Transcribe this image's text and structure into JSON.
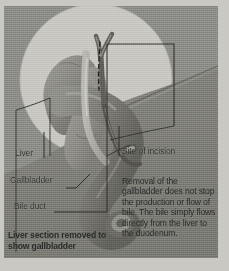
{
  "figure": {
    "type": "medical-illustration",
    "style": "grayscale halftone print scan"
  },
  "labels": {
    "liver": "Liver",
    "gallbladder": "Gallbladder",
    "bile_duct": "Bile duct",
    "site_of_incision": "Site of incision"
  },
  "body_text": {
    "removal_note": "Removal of the gallbladder does not stop the production or flow of bile. The bile simply flows directly from the liver to the duodenum."
  },
  "captions": {
    "liver_section": "Liver section removed to show gallbladder"
  },
  "colors": {
    "page_background": "#c9c8c3",
    "panel_background": "#8d8d88",
    "inset_circle": "#c8c7c2",
    "organ_mid": "#9a9a94",
    "organ_dark": "#77776f",
    "organ_shadow": "#63635c",
    "duct_light": "#c2c1bb",
    "line": "#2f2f2d",
    "text": "#2b2b2b"
  }
}
